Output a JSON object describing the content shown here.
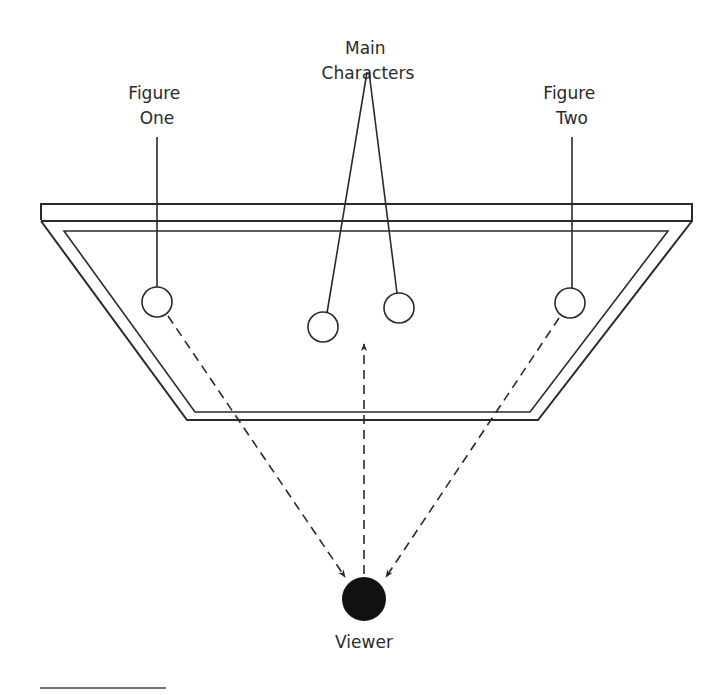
{
  "labels": {
    "figure_one": [
      "Figure",
      "One"
    ],
    "main_characters": [
      "Main",
      "Characters"
    ],
    "figure_two": [
      "Figure",
      "Two"
    ],
    "viewer": "Viewer"
  },
  "colors": {
    "line": "#2a2a2a",
    "viewer_fill": "#111111",
    "background": "#ffffff"
  },
  "elements": {
    "stage": {
      "description": "trapezoidal stage viewed from above with raised front edge"
    },
    "figures": [
      {
        "id": "figure-one",
        "cx": 157,
        "cy": 302
      },
      {
        "id": "main-character-left",
        "cx": 323,
        "cy": 327
      },
      {
        "id": "main-character-right",
        "cx": 399,
        "cy": 308
      },
      {
        "id": "figure-two",
        "cx": 570,
        "cy": 303
      }
    ],
    "viewer": {
      "cx": 364,
      "cy": 598
    },
    "sightlines": [
      {
        "from": "figure-one",
        "to": "viewer",
        "style": "dashed-arrow"
      },
      {
        "from": "viewer",
        "to": "main-characters",
        "style": "dashed-arrow"
      },
      {
        "from": "figure-two",
        "to": "viewer",
        "style": "dashed-arrow"
      }
    ]
  }
}
